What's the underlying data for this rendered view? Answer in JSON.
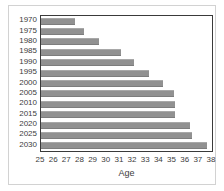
{
  "chart_data": {
    "type": "bar",
    "orientation": "horizontal",
    "title": "",
    "xlabel": "Age",
    "ylabel": "",
    "xlim": [
      25,
      38
    ],
    "ylim": null,
    "grid": false,
    "legend": null,
    "xticks": [
      25,
      26,
      27,
      28,
      29,
      30,
      31,
      32,
      33,
      34,
      35,
      36,
      37,
      38
    ],
    "xticklabels": [
      "25",
      "26",
      "27",
      "28",
      "29",
      "30",
      "31",
      "32",
      "33",
      "34",
      "35",
      "36",
      "37",
      "38"
    ],
    "categories": [
      "1970",
      "1975",
      "1980",
      "1985",
      "1990",
      "1995",
      "2000",
      "2005",
      "2010",
      "2015",
      "2020",
      "2025",
      "2030"
    ],
    "values": [
      27.6,
      28.3,
      29.4,
      31.1,
      32.1,
      33.2,
      34.3,
      35.1,
      35.2,
      35.2,
      36.3,
      36.5,
      37.6
    ],
    "bar_color": "#919191",
    "axis_color": "#3a3a3a",
    "background_color": "#ffffff"
  }
}
